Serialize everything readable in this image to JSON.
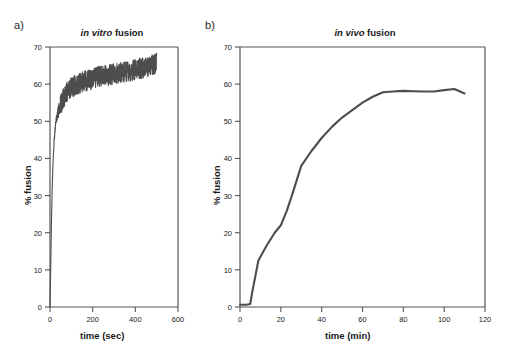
{
  "figure": {
    "background": "#ffffff",
    "line_color": "#4d4d4d",
    "axis_color": "#555555",
    "text_color": "#1a1a1a"
  },
  "panels": {
    "a": {
      "label": "a)",
      "title_italic": "in vitro",
      "title_rest": " fusion",
      "xlabel": "time (sec)",
      "ylabel": "% fusion",
      "xticks": [
        "0",
        "200",
        "400",
        "600"
      ],
      "yticks": [
        "0",
        "10",
        "20",
        "30",
        "40",
        "50",
        "60",
        "70"
      ]
    },
    "b": {
      "label": "b)",
      "title_italic": "in vivo",
      "title_rest": " fusion",
      "xlabel": "time (min)",
      "ylabel": "% fusion",
      "xticks": [
        "0",
        "20",
        "40",
        "60",
        "80",
        "100",
        "120"
      ],
      "yticks": [
        "0",
        "10",
        "20",
        "30",
        "40",
        "50",
        "60",
        "70"
      ]
    }
  },
  "chart_data": [
    {
      "type": "line",
      "title": "in vitro fusion",
      "panel": "a",
      "xlabel": "time (sec)",
      "ylabel": "% fusion",
      "xlim": [
        0,
        600
      ],
      "ylim": [
        0,
        70
      ],
      "xticks": [
        0,
        200,
        400,
        600
      ],
      "yticks": [
        0,
        10,
        20,
        30,
        40,
        50,
        60,
        70
      ],
      "grid": false,
      "legend": "none",
      "noise_amplitude": 2.8,
      "description": "Rapid sigmoidal-exponential rise from 0% at t=0 to ~55% by t=50 sec, then slow noisy climb to ~65% at t=500 sec. Trace is noisy throughout the plateau.",
      "x": [
        0,
        2,
        4,
        6,
        8,
        10,
        13,
        16,
        20,
        25,
        30,
        35,
        40,
        50,
        60,
        75,
        90,
        110,
        130,
        150,
        175,
        200,
        225,
        250,
        275,
        300,
        325,
        350,
        375,
        400,
        425,
        450,
        470,
        490,
        500
      ],
      "y": [
        0,
        6,
        13,
        20,
        26,
        31,
        37,
        41,
        45,
        48.5,
        50.5,
        52,
        53,
        54.5,
        56,
        57.5,
        58.5,
        59.5,
        60,
        60.5,
        61,
        61.5,
        62,
        62.3,
        62.5,
        62.8,
        63,
        63.3,
        63.5,
        64,
        64.3,
        64.6,
        65,
        65.5,
        66
      ]
    },
    {
      "type": "line",
      "title": "in vivo fusion",
      "panel": "b",
      "xlabel": "time (min)",
      "ylabel": "% fusion",
      "xlim": [
        0,
        120
      ],
      "ylim": [
        0,
        70
      ],
      "xticks": [
        0,
        20,
        40,
        60,
        80,
        100,
        120
      ],
      "yticks": [
        0,
        10,
        20,
        30,
        40,
        50,
        60,
        70
      ],
      "grid": false,
      "legend": "none",
      "description": "Flat lag near 0% until ~5 min, then steep rise to ~12.5% at 9 min, continuing up to ~22% at 20 min and ~38% at 30 min, gradually saturating to a plateau of ~58% from 70 min, ending ~57.5% at 110 min.",
      "x": [
        0,
        3,
        5,
        6,
        9,
        13,
        17,
        20,
        23,
        26,
        30,
        35,
        40,
        45,
        50,
        55,
        60,
        65,
        70,
        75,
        80,
        85,
        90,
        95,
        100,
        105,
        110
      ],
      "y": [
        0.6,
        0.6,
        0.8,
        4.0,
        12.5,
        16.5,
        20.0,
        22.0,
        26.0,
        31.0,
        38.0,
        42.0,
        45.5,
        48.5,
        51.0,
        53.0,
        55.0,
        56.6,
        57.8,
        58.0,
        58.2,
        58.1,
        58.0,
        58.0,
        58.4,
        58.7,
        57.5
      ]
    }
  ]
}
